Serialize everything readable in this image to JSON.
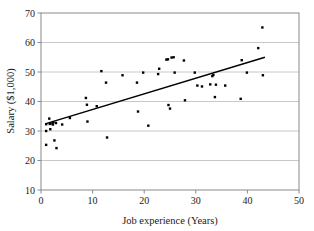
{
  "chart_data": {
    "type": "scatter",
    "title": "",
    "xlabel": "Job experience (Years)",
    "ylabel": "Salary ($1,000)",
    "xlim": [
      0,
      50
    ],
    "ylim": [
      10,
      70
    ],
    "xticks": [
      0,
      10,
      20,
      30,
      40,
      50
    ],
    "yticks": [
      10,
      20,
      30,
      40,
      50,
      60,
      70
    ],
    "xtick_labels": [
      "0",
      "10",
      "20",
      "30",
      "40",
      "50"
    ],
    "ytick_labels": [
      "10",
      "20",
      "30",
      "40",
      "50",
      "60",
      "70"
    ],
    "grid": "horizontal",
    "grid_color": "#c8c8c8",
    "frame_color": "#8a8a8a",
    "marker_color": "#000000",
    "marker_shape": "square",
    "marker_size": 2.4,
    "legend": "none",
    "points": [
      [
        1.0,
        32.3
      ],
      [
        1.0,
        30.0
      ],
      [
        1.0,
        25.3
      ],
      [
        1.6,
        34.2
      ],
      [
        1.7,
        32.4
      ],
      [
        1.8,
        30.6
      ],
      [
        2.2,
        32.6
      ],
      [
        2.3,
        32.2
      ],
      [
        2.4,
        33.0
      ],
      [
        2.6,
        26.8
      ],
      [
        2.9,
        32.7
      ],
      [
        3.0,
        24.2
      ],
      [
        4.1,
        32.2
      ],
      [
        5.6,
        34.4
      ],
      [
        8.7,
        41.2
      ],
      [
        8.9,
        38.9
      ],
      [
        9.0,
        33.2
      ],
      [
        10.8,
        38.4
      ],
      [
        11.7,
        50.3
      ],
      [
        12.6,
        46.4
      ],
      [
        12.8,
        27.8
      ],
      [
        15.8,
        48.9
      ],
      [
        18.6,
        46.4
      ],
      [
        18.8,
        36.6
      ],
      [
        19.8,
        49.8
      ],
      [
        20.8,
        31.8
      ],
      [
        22.7,
        49.3
      ],
      [
        22.9,
        51.1
      ],
      [
        24.3,
        54.2
      ],
      [
        24.6,
        54.3
      ],
      [
        24.7,
        38.8
      ],
      [
        25.0,
        37.6
      ],
      [
        25.3,
        54.9
      ],
      [
        25.7,
        55.0
      ],
      [
        25.9,
        49.8
      ],
      [
        27.7,
        53.9
      ],
      [
        27.9,
        40.4
      ],
      [
        29.8,
        49.8
      ],
      [
        30.3,
        45.4
      ],
      [
        31.2,
        45.1
      ],
      [
        32.8,
        45.8
      ],
      [
        33.2,
        48.6
      ],
      [
        33.4,
        49.0
      ],
      [
        33.7,
        41.5
      ],
      [
        33.9,
        45.7
      ],
      [
        35.7,
        45.4
      ],
      [
        38.7,
        40.9
      ],
      [
        38.9,
        54.0
      ],
      [
        39.9,
        49.8
      ],
      [
        42.1,
        58.1
      ],
      [
        42.9,
        65.1
      ],
      [
        43.0,
        48.9
      ]
    ],
    "trendline": {
      "x0": 0.8,
      "y0": 32.4,
      "x1": 43.4,
      "y1": 55.0,
      "color": "#000000",
      "width": 1.4
    }
  }
}
